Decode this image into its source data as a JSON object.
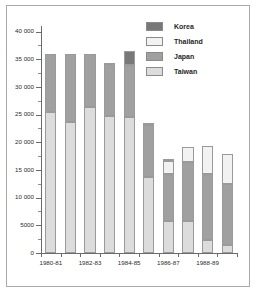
{
  "chart_data": {
    "type": "bar",
    "subtype": "stacked-vertical",
    "title": "",
    "xlabel": "",
    "ylabel": "",
    "ylim": [
      0,
      41000
    ],
    "grid": false,
    "legend_position": "top-right",
    "y_ticks": [
      0,
      5000,
      10000,
      15000,
      20000,
      25000,
      30000,
      35000,
      40000
    ],
    "y_tick_labels": [
      "0",
      "5000",
      "10 000",
      "15 000",
      "20 000",
      "25 000",
      "30 000",
      "35 000",
      "40 000"
    ],
    "categories": [
      "1980-81",
      "1981-82",
      "1982-83",
      "1983-84",
      "1984-85",
      "1985-86",
      "1986-87",
      "1987-88",
      "1988-89",
      "1989-90"
    ],
    "x_tick_labels_shown": [
      "1980-81",
      "1982-83",
      "1984-85",
      "1986-87",
      "1988-89"
    ],
    "series": [
      {
        "name": "Taiwan",
        "color": "#dcdcdc",
        "values": [
          25400,
          23600,
          26300,
          24700,
          24500,
          13800,
          5800,
          5700,
          2300,
          1400
        ]
      },
      {
        "name": "Japan",
        "color": "#a0a0a0",
        "values": [
          10600,
          12400,
          9700,
          9400,
          9400,
          9400,
          8500,
          10800,
          12000,
          11000
        ]
      },
      {
        "name": "Thailand",
        "color": "#f2f2f2",
        "values": [
          0,
          0,
          0,
          0,
          0,
          0,
          2300,
          2700,
          5000,
          5500
        ]
      },
      {
        "name": "Korea",
        "color": "#787878",
        "values": [
          0,
          0,
          0,
          300,
          2600,
          300,
          300,
          0,
          0,
          0
        ]
      }
    ],
    "stack_order": [
      "Taiwan",
      "Japan",
      "Thailand",
      "Korea"
    ],
    "totals": [
      36000,
      36000,
      36000,
      34400,
      36500,
      23500,
      16900,
      19200,
      19300,
      17900
    ]
  },
  "legend": {
    "items": [
      {
        "label": "Korea",
        "color": "#787878"
      },
      {
        "label": "Thailand",
        "color": "#f2f2f2"
      },
      {
        "label": "Japan",
        "color": "#a0a0a0"
      },
      {
        "label": "Taiwan",
        "color": "#dcdcdc"
      }
    ]
  }
}
